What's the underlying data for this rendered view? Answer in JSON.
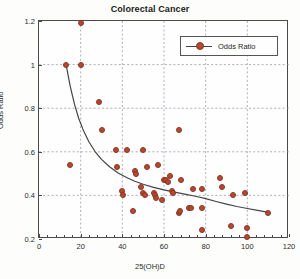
{
  "chart_data": {
    "type": "scatter",
    "title": "Colorectal Cancer",
    "xlabel": "25(OH)D",
    "ylabel": "Odds Ratio",
    "xlim": [
      0,
      120
    ],
    "ylim": [
      0.2,
      1.2
    ],
    "xticks": [
      0,
      20,
      40,
      60,
      80,
      100,
      120
    ],
    "yticks": [
      0.2,
      0.4,
      0.6,
      0.8,
      1,
      1.2
    ],
    "xtick_labels": [
      "0",
      "20",
      "40",
      "60",
      "80",
      "100",
      "120"
    ],
    "ytick_labels": [
      "0.2",
      "0.4",
      "0.6",
      "0.8",
      "1",
      "1.2"
    ],
    "grid": true,
    "legend": {
      "position": "top-right",
      "entries": [
        "Odds Ratio"
      ]
    },
    "marker_color": "#b5492f",
    "line_color": "#444444",
    "series": [
      {
        "name": "Odds Ratio",
        "points": [
          [
            13,
            1.0
          ],
          [
            15,
            0.54
          ],
          [
            20,
            1.19
          ],
          [
            20,
            1.0
          ],
          [
            29,
            0.83
          ],
          [
            30,
            0.7
          ],
          [
            37,
            0.61
          ],
          [
            37.5,
            0.53
          ],
          [
            40,
            0.42
          ],
          [
            40.5,
            0.4
          ],
          [
            42,
            0.61
          ],
          [
            45,
            0.33
          ],
          [
            46,
            0.51
          ],
          [
            46.5,
            0.5
          ],
          [
            49,
            0.44
          ],
          [
            50,
            0.61
          ],
          [
            50,
            0.41
          ],
          [
            51,
            0.4
          ],
          [
            52,
            0.53
          ],
          [
            55,
            0.41
          ],
          [
            55.5,
            0.4
          ],
          [
            56,
            0.39
          ],
          [
            57,
            0.54
          ],
          [
            59,
            0.38
          ],
          [
            60,
            0.47
          ],
          [
            61,
            0.47
          ],
          [
            62,
            0.46
          ],
          [
            63,
            0.49
          ],
          [
            64,
            0.42
          ],
          [
            64.5,
            0.41
          ],
          [
            67,
            0.7
          ],
          [
            67,
            0.32
          ],
          [
            67.5,
            0.33
          ],
          [
            68,
            0.47
          ],
          [
            72,
            0.34
          ],
          [
            73,
            0.34
          ],
          [
            74,
            0.43
          ],
          [
            78,
            0.43
          ],
          [
            78,
            0.34
          ],
          [
            78,
            0.24
          ],
          [
            87,
            0.48
          ],
          [
            88,
            0.44
          ],
          [
            92,
            0.26
          ],
          [
            93,
            0.4
          ],
          [
            99,
            0.41
          ],
          [
            100,
            0.25
          ],
          [
            100,
            0.21
          ],
          [
            110,
            0.32
          ]
        ]
      }
    ],
    "trend_curve": {
      "name": "fitted-trend",
      "points": [
        [
          13,
          1.0
        ],
        [
          15,
          0.9
        ],
        [
          17,
          0.82
        ],
        [
          19,
          0.755
        ],
        [
          21,
          0.705
        ],
        [
          24,
          0.645
        ],
        [
          27,
          0.6
        ],
        [
          30,
          0.565
        ],
        [
          34,
          0.53
        ],
        [
          38,
          0.503
        ],
        [
          42,
          0.482
        ],
        [
          46,
          0.465
        ],
        [
          50,
          0.451
        ],
        [
          55,
          0.437
        ],
        [
          60,
          0.425
        ],
        [
          65,
          0.415
        ],
        [
          70,
          0.406
        ],
        [
          75,
          0.396
        ],
        [
          80,
          0.385
        ],
        [
          85,
          0.372
        ],
        [
          90,
          0.36
        ],
        [
          95,
          0.349
        ],
        [
          100,
          0.34
        ],
        [
          105,
          0.331
        ],
        [
          110,
          0.322
        ]
      ]
    }
  }
}
